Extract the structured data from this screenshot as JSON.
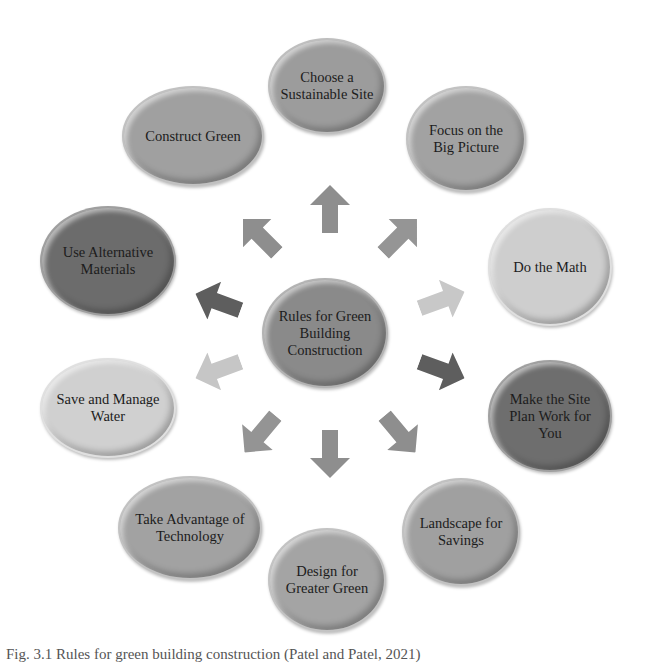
{
  "center": {
    "label": "Rules for Green Building Construction",
    "color": "#8a8a8a"
  },
  "nodes": [
    {
      "label": "Choose a Sustainable Site",
      "color": "#9c9c9c"
    },
    {
      "label": "Focus on the Big Picture",
      "color": "#a2a2a2"
    },
    {
      "label": "Do the Math",
      "color": "#cecece"
    },
    {
      "label": "Make the Site Plan Work for You",
      "color": "#6e6e6e"
    },
    {
      "label": "Landscape for Savings",
      "color": "#a0a0a0"
    },
    {
      "label": "Design for Greater Green",
      "color": "#a4a4a4"
    },
    {
      "label": "Take Advantage of Technology",
      "color": "#a2a2a2"
    },
    {
      "label": "Save and Manage Water",
      "color": "#d0d0d0"
    },
    {
      "label": "Use Alternative Materials",
      "color": "#6c6c6c"
    },
    {
      "label": "Construct Green",
      "color": "#a0a0a0"
    }
  ],
  "arrows": [
    {
      "direction": "up",
      "color": "#8e8e8e"
    },
    {
      "direction": "up-right",
      "color": "#959595"
    },
    {
      "direction": "right",
      "color": "#c8c8c8"
    },
    {
      "direction": "down-right",
      "color": "#5e5e5e"
    },
    {
      "direction": "down-right",
      "color": "#8e8e8e"
    },
    {
      "direction": "down",
      "color": "#8e8e8e"
    },
    {
      "direction": "down-left",
      "color": "#949494"
    },
    {
      "direction": "left",
      "color": "#c6c6c6"
    },
    {
      "direction": "left",
      "color": "#5e5e5e"
    },
    {
      "direction": "up-left",
      "color": "#8e8e8e"
    }
  ],
  "caption": "Fig. 3.1 Rules for green building construction (Patel and Patel, 2021)"
}
